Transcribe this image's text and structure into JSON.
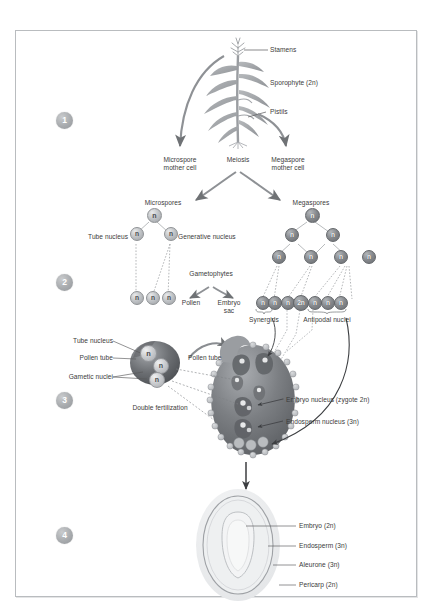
{
  "diagram": {
    "steps": [
      "1",
      "2",
      "3",
      "4"
    ],
    "nucleus_glyphs": {
      "haploid": "n",
      "triploid": "2n"
    }
  },
  "stage1": {
    "labels": {
      "stamens": "Stamens",
      "sporophyte": "Sporophyte (2n)",
      "pistils": "Pistils",
      "microspore_mother_cell": "Microspore\nmother cell",
      "meiosis": "Meiosis",
      "megaspore_mother_cell": "Megaspore\nmother cell"
    }
  },
  "stage2": {
    "labels": {
      "microspores": "Microspores",
      "megaspores": "Megaspores",
      "tube_nucleus": "Tube nucleus",
      "generative_nucleus": "Generative nucleus",
      "gametophytes": "Gametophytes",
      "pollen": "Pollen",
      "embryo_sac": "Embryo\nsac",
      "synergids": "Synergids",
      "antipodal_nuclei": "Antipodal nuclei"
    },
    "microspore_tree": {
      "root": "n",
      "level2": [
        "n",
        "n"
      ],
      "level3": [
        "n",
        "n",
        "n"
      ]
    },
    "megaspore_tree": {
      "root": "n",
      "level2": [
        "n",
        "n"
      ],
      "level3": [
        "n",
        "n",
        "n",
        "n"
      ],
      "level4": [
        "n",
        "n",
        "n",
        "2n",
        "n",
        "n",
        "n"
      ]
    }
  },
  "stage3": {
    "labels": {
      "tube_nucleus": "Tube nucleus",
      "pollen_tube_left": "Pollen tube",
      "gametic_nuclei": "Gametic nuclei",
      "pollen_tube_right": "Pollen tube",
      "double_fertilization": "Double fertilization",
      "embryo_nucleus": "Embryo nucleus (zygote 2n)",
      "endosperm_nucleus": "Endosperm nucleus (3n)"
    },
    "pollen_grain_nuclei": [
      "n",
      "n",
      "n"
    ]
  },
  "stage4": {
    "labels": {
      "embryo": "Embryo (2n)",
      "endosperm": "Endosperm (3n)",
      "aleurone": "Aleurone (3n)",
      "pericarp": "Pericarp (2n)"
    }
  },
  "colors": {
    "frame_border": "#b9bcbf",
    "text": "#3b3b3b",
    "leader_line": "#58585a",
    "arrow": "#6f7275",
    "nucleus_dark": "#85888c",
    "nucleus_light": "#c0c3c6",
    "step_badge": "#a8abae"
  }
}
